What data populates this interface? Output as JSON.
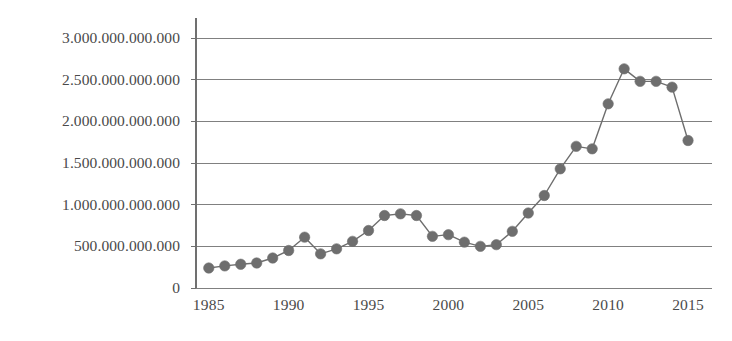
{
  "chart_data": {
    "type": "line",
    "title": "",
    "subtitle": "",
    "xlabel": "",
    "ylabel": "",
    "grid": "horizontal",
    "legend": "none",
    "marker": "circle",
    "series_color": "#6e6e6e",
    "gridline_color": "#808080",
    "axis_color": "#707070",
    "x": [
      1985,
      1986,
      1987,
      1988,
      1989,
      1990,
      1991,
      1992,
      1993,
      1994,
      1995,
      1996,
      1997,
      1998,
      1999,
      2000,
      2001,
      2002,
      2003,
      2004,
      2005,
      2006,
      2007,
      2008,
      2009,
      2010,
      2011,
      2012,
      2013,
      2014,
      2015
    ],
    "values": [
      240000000000,
      265000000000,
      285000000000,
      300000000000,
      360000000000,
      450000000000,
      610000000000,
      410000000000,
      470000000000,
      560000000000,
      690000000000,
      870000000000,
      890000000000,
      870000000000,
      620000000000,
      640000000000,
      550000000000,
      500000000000,
      520000000000,
      680000000000,
      900000000000,
      1110000000000,
      1430000000000,
      1700000000000,
      1670000000000,
      2210000000000,
      2630000000000,
      2480000000000,
      2480000000000,
      2410000000000,
      1770000000000
    ],
    "xlim": [
      1984.2,
      2016.5
    ],
    "ylim": [
      0,
      3000000000000
    ],
    "x_ticks": [
      1985,
      1990,
      1995,
      2000,
      2005,
      2010,
      2015
    ],
    "x_tick_labels": [
      "1985",
      "1990",
      "1995",
      "2000",
      "2005",
      "2010",
      "2015"
    ],
    "y_ticks": [
      0,
      500000000000,
      1000000000000,
      1500000000000,
      2000000000000,
      2500000000000,
      3000000000000
    ],
    "y_tick_labels": [
      "0",
      "500.000.000.000",
      "1.000.000.000.000",
      "1.500.000.000.000",
      "2.000.000.000.000",
      "2.500.000.000.000",
      "3.000.000.000.000"
    ]
  }
}
